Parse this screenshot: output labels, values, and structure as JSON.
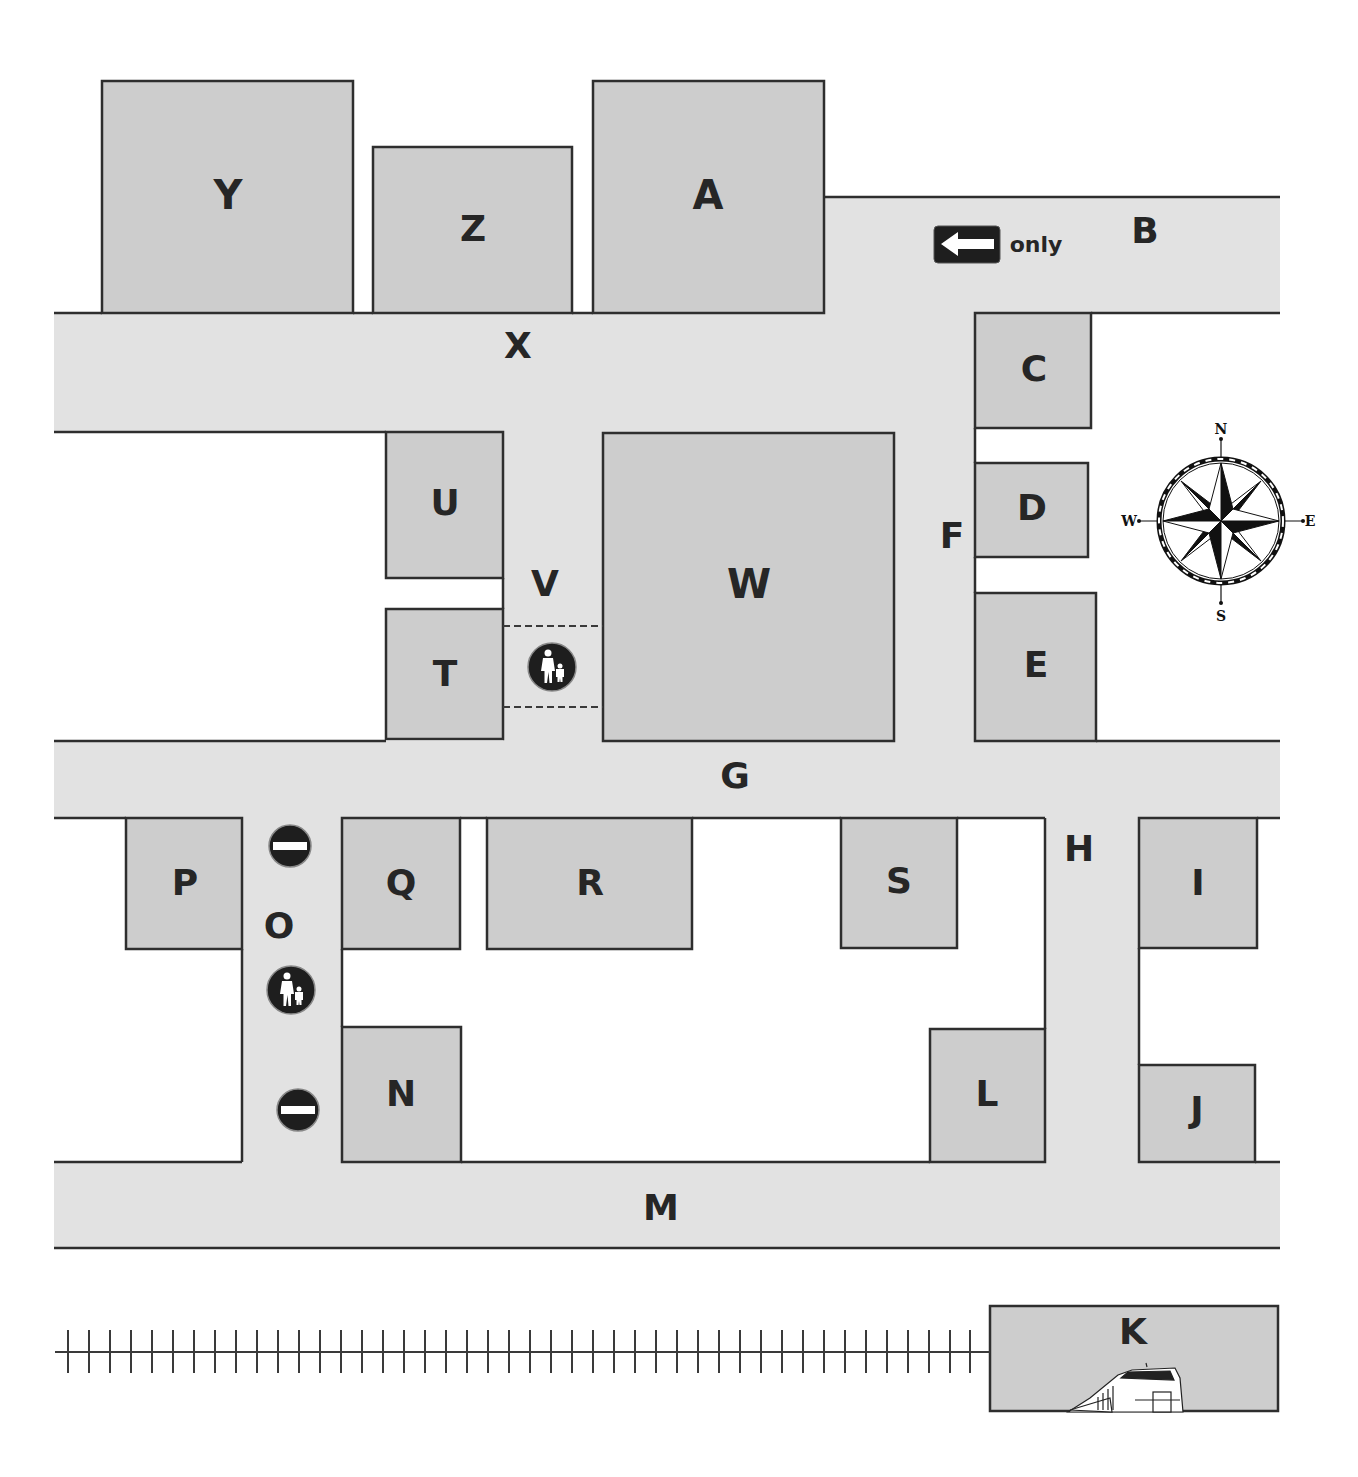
{
  "colors": {
    "road": "#e2e2e2",
    "building": "#cdcdcd",
    "outline": "#2e2e2e",
    "label": "#262626",
    "sign": "#1e1e1e",
    "background": "#ffffff"
  },
  "roads": [
    {
      "id": "B",
      "label": "B",
      "orientation": "horizontal"
    },
    {
      "id": "X",
      "label": "X",
      "orientation": "horizontal"
    },
    {
      "id": "F",
      "label": "F",
      "orientation": "vertical"
    },
    {
      "id": "V",
      "label": "V",
      "orientation": "vertical"
    },
    {
      "id": "G",
      "label": "G",
      "orientation": "horizontal"
    },
    {
      "id": "O",
      "label": "O",
      "orientation": "vertical"
    },
    {
      "id": "H",
      "label": "H",
      "orientation": "vertical"
    },
    {
      "id": "M",
      "label": "M",
      "orientation": "horizontal"
    }
  ],
  "road_labels": {
    "B": "B",
    "X": "X",
    "F": "F",
    "V": "V",
    "G": "G",
    "O": "O",
    "H": "H",
    "M": "M"
  },
  "buildings": {
    "Y": "Y",
    "Z": "Z",
    "A": "A",
    "C": "C",
    "D": "D",
    "E": "E",
    "U": "U",
    "T": "T",
    "W": "W",
    "P": "P",
    "Q": "Q",
    "R": "R",
    "S": "S",
    "I": "I",
    "N": "N",
    "L": "L",
    "J": "J",
    "K": "K"
  },
  "signs": {
    "one_way": {
      "direction": "west",
      "text": "only",
      "icon": "left-arrow-icon",
      "road": "B"
    },
    "pedestrian_crossing_v": {
      "icon": "pedestrian-icon",
      "road": "V"
    },
    "no_entry_north_o": {
      "icon": "no-entry-icon",
      "road": "O"
    },
    "pedestrian_o": {
      "icon": "pedestrian-icon",
      "road": "O"
    },
    "no_entry_south_o": {
      "icon": "no-entry-icon",
      "road": "O"
    }
  },
  "compass": {
    "N": "N",
    "S": "S",
    "E": "E",
    "W": "W"
  },
  "railway": {
    "label": "railway",
    "station": "K",
    "icon": "train-icon"
  }
}
